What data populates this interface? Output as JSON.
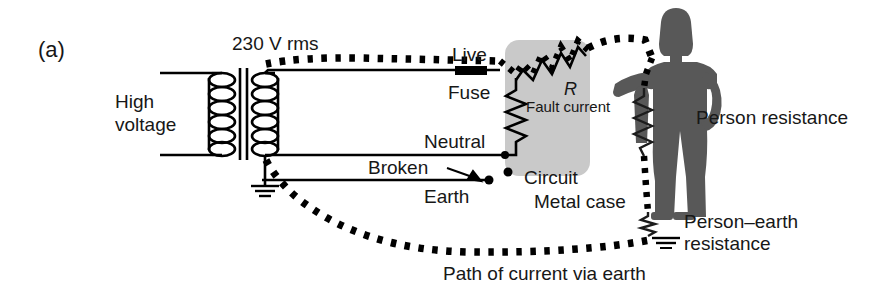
{
  "figure": {
    "panel_label": "(a)",
    "caption": "Path of current via earth"
  },
  "labels": {
    "high_voltage": "High\nvoltage",
    "high_voltage_line1": "High",
    "high_voltage_line2": "voltage",
    "supply_voltage": "230 V rms",
    "live": "Live",
    "fuse": "Fuse",
    "neutral": "Neutral",
    "broken": "Broken",
    "earth": "Earth",
    "resistor_symbol": "R",
    "fault_current": "Fault current",
    "circuit": "Circuit",
    "metal_case": "Metal case",
    "person_resistance": "Person resistance",
    "person_earth_line1": "Person–earth",
    "person_earth_line2": "resistance"
  },
  "icons": {
    "earth_supply": "earth-ground-icon",
    "earth_person": "earth-ground-icon",
    "transformer": "transformer-icon",
    "fuse": "fuse-icon",
    "resistor_circuit": "resistor-zigzag-icon",
    "resistor_fault": "resistor-zigzag-icon",
    "resistor_person": "resistor-zigzag-icon",
    "resistor_person_earth": "resistor-zigzag-icon",
    "person": "person-silhouette-icon",
    "broken_arrow": "arrow-pointer-icon"
  },
  "colors": {
    "background": "#ffffff",
    "wire": "#000000",
    "metal_case_fill": "#c9c9c9",
    "person_fill": "#585858",
    "text": "#171717"
  }
}
